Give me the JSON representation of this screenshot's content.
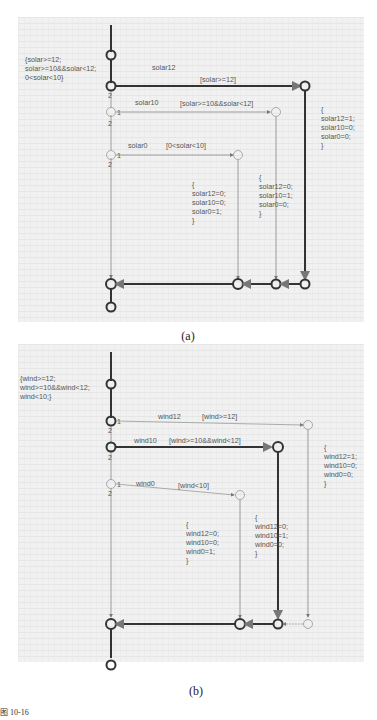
{
  "panel_a": {
    "caption": "(a)",
    "condition_note": [
      "{solar>=12;",
      "solar>=10&&solar<12;",
      "0<solar<10}"
    ],
    "events": {
      "e12": "solar12",
      "e10": "solar10",
      "e0": "solar0"
    },
    "guards": {
      "g12": "[solar>=12]",
      "g10": "[solar>=10&&solar<12]",
      "g0": "[0<solar<10]"
    },
    "action_12": [
      "{",
      "solar12=1;",
      "solar10=0;",
      "solar0=0;",
      "}"
    ],
    "action_10": [
      "{",
      "solar12=0;",
      "solar10=1;",
      "solar0=0;",
      "}"
    ],
    "action_0": [
      "{",
      "solar12=0;",
      "solar10=0;",
      "solar0=1;",
      "}"
    ],
    "priorities": {
      "one": "1",
      "two": "2"
    }
  },
  "panel_b": {
    "caption": "(b)",
    "condition_note": [
      "{wind>=12;",
      "wind>=10&&wind<12;",
      "wind<10;}"
    ],
    "events": {
      "e12": "wind12",
      "e10": "wind10",
      "e0": "wind0"
    },
    "guards": {
      "g12": "[wind>=12]",
      "g10": "[wind>=10&&wind<12]",
      "g0": "[wind<10]"
    },
    "action_12": [
      "{",
      "wind12=1;",
      "wind10=0;",
      "wind0=0;",
      "}"
    ],
    "action_10": [
      "{",
      "wind12=0;",
      "wind10=1;",
      "wind0=0;",
      "}"
    ],
    "action_0": [
      "{",
      "wind12=0;",
      "wind10=0;",
      "wind0=1;",
      "}"
    ],
    "priorities": {
      "one": "1",
      "two": "2"
    }
  },
  "footer": "图 10-16"
}
